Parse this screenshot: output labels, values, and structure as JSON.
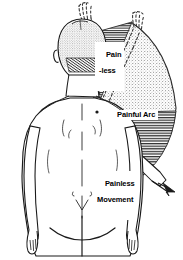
{
  "figure": {
    "kind": "medical-illustration",
    "view": "posterior-back-view",
    "width_px": 183,
    "height_px": 260,
    "background_color": "#ffffff",
    "ink_color": "#1a1a1a"
  },
  "labels": {
    "painless_high": {
      "line1": "Pain",
      "line2": "-less"
    },
    "painful_arc": "Painful Arc",
    "painless_movement": {
      "line1": "Painless",
      "line2": "Movement"
    }
  },
  "zones": [
    {
      "name": "painless-high-zone",
      "label": "Pain -less",
      "fill": "horizontal-hatch",
      "fill_color": "#2b2b2b",
      "position": "upper",
      "description": "high elevation shoulder abduction, hatched, pain free"
    },
    {
      "name": "painful-arc-zone",
      "label": "Painful Arc",
      "fill": "stipple",
      "fill_color": "#9a9a9a",
      "position": "middle",
      "description": "mid range shoulder abduction, stippled, painful"
    },
    {
      "name": "painless-movement-zone",
      "label": "Painless Movement",
      "fill": "horizontal-hatch",
      "fill_color": "#2b2b2b",
      "position": "lower",
      "description": "low elevation shoulder abduction, hatched, pain free"
    }
  ],
  "annotations": {
    "dashed_arms": 2,
    "dashed_arm_note": "raised arm positions drawn as dashed outlines",
    "solid_arm_note": "lowered arm drawn with solid outline inside painless movement zone",
    "arrow_note": "arrow indicating direction of movement at low range"
  },
  "colors": {
    "ink": "#1a1a1a",
    "stipple": "#9a9a9a",
    "hatch": "#2b2b2b",
    "paper": "#ffffff",
    "hair_shading": "#3a3a3a"
  }
}
